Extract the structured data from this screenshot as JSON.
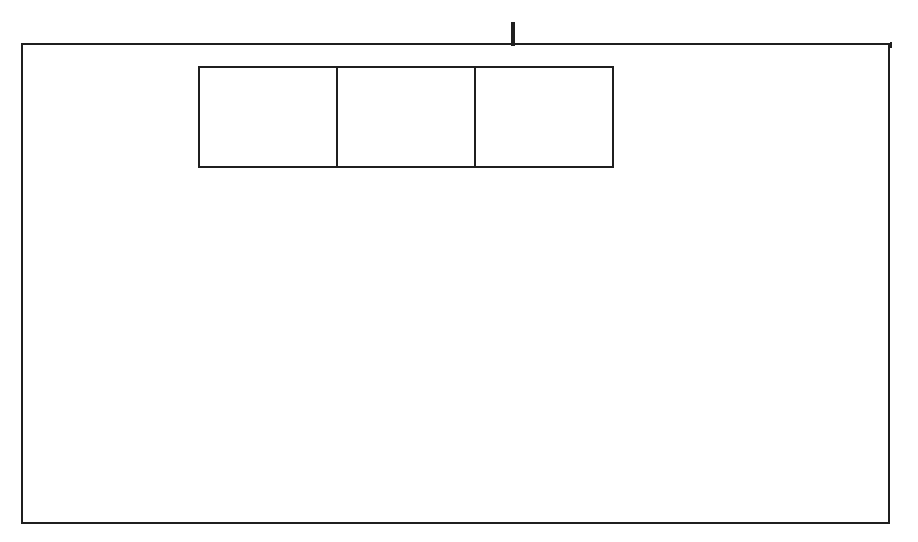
{
  "header": {
    "cells": [
      "sm0",
      "sm1",
      "as1",
      "as0",
      "ea",
      "e",
      "ra0",
      "ra1",
      "mr0",
      "mr1"
    ],
    "widths": [
      40,
      39,
      39,
      39,
      40,
      40,
      38,
      39,
      40,
      38
    ]
  },
  "top_row": {
    "boxes": [
      {
        "input": "mr0",
        "event": "rec",
        "state": "R1"
      },
      {
        "input": "mr1",
        "event": "ra1",
        "state": "R"
      },
      {
        "input": "e",
        "event": "ra1",
        "state": "R"
      }
    ],
    "send": {
      "input": "send",
      "state": "S1"
    }
  },
  "groups": [
    {
      "input": "sm1",
      "cells": [
        {
          "event": "mr1",
          "state": "M1"
        },
        {
          "event": "e",
          "state": "M1"
        },
        {
          "event": "",
          "state": "M1"
        }
      ]
    },
    {
      "input": "sm0",
      "cells": [
        {
          "event": "mr0",
          "state": "M1"
        },
        {
          "event": "e",
          "state": "M1"
        },
        {
          "event": "",
          "state": "M1"
        }
      ]
    },
    {
      "input": "ra1",
      "cells": [
        {
          "event": "as1",
          "state": "M2"
        },
        {
          "event": "ea",
          "state": "M2"
        },
        {
          "event": "",
          "state": "M2"
        }
      ]
    },
    {
      "input": "ra0",
      "cells": [
        {
          "event": "as0",
          "state": "M2"
        },
        {
          "event": "ea",
          "state": "M2"
        },
        {
          "event": "",
          "state": "M2"
        }
      ]
    }
  ],
  "colors": {
    "line": "#1f1f1f",
    "background": "#ffffff"
  }
}
